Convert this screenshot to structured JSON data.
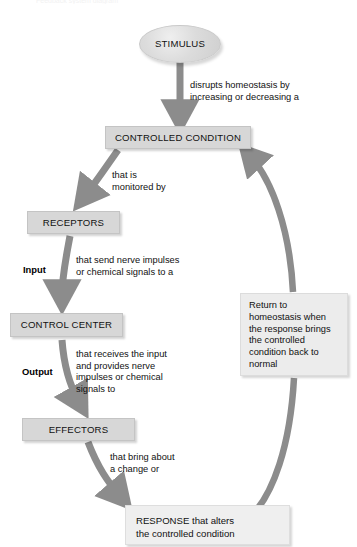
{
  "figure": {
    "top_caption_fragment": "Feedback system diagram",
    "arrow_color": "#8c8c8c",
    "node_fill": "#d7d7d7",
    "text_color": "#111111"
  },
  "nodes": {
    "stimulus": {
      "label": "STIMULUS",
      "shape": "ellipse"
    },
    "controlled_condition": {
      "label": "CONTROLLED CONDITION",
      "shape": "rect"
    },
    "receptors": {
      "label": "RECEPTORS",
      "shape": "rect"
    },
    "control_center": {
      "label": "CONTROL CENTER",
      "shape": "rect"
    },
    "effectors": {
      "label": "EFFECTORS",
      "shape": "rect"
    },
    "response": {
      "label": "RESPONSE that alters\nthe controlled condition",
      "shape": "rect"
    },
    "return_note": {
      "label": "Return to\nhomeostasis when\nthe response brings\nthe controlled\ncondition back to\nnormal",
      "shape": "rect"
    }
  },
  "edge_captions": {
    "stimulus_to_controlled": "disrupts homeostasis by\nincreasing or decreasing a",
    "controlled_to_receptors": "that is\nmonitored by",
    "receptors_to_control_center": "that send nerve impulses\nor chemical signals to a",
    "control_center_to_effectors": "that receives the input\nand provides nerve\nimpulses or chemical\nsignals to",
    "effectors_to_response": "that bring about\na change or"
  },
  "io_labels": {
    "input": "Input",
    "output": "Output"
  }
}
